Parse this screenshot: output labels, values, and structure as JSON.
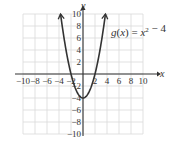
{
  "chart_data": {
    "type": "line",
    "title": "",
    "function_label": "g(x) = x² − 4",
    "function_name": "g(x)",
    "function_expr": "x² − 4",
    "xlabel": "x",
    "ylabel": "y",
    "xlim": [
      -10,
      10
    ],
    "ylim": [
      -10,
      10
    ],
    "grid": true,
    "grid_step": 2,
    "x_ticks": [
      -10,
      -8,
      -6,
      -4,
      -2,
      2,
      4,
      6,
      8,
      10
    ],
    "y_ticks": [
      10,
      8,
      6,
      4,
      2,
      -2,
      -4,
      -6,
      -8,
      -10
    ],
    "x_tick_labels": [
      "−10",
      "−8",
      "−6",
      "−4",
      "−2",
      "2",
      "4",
      "6",
      "8",
      "10"
    ],
    "y_tick_labels": [
      "10",
      "8",
      "6",
      "4",
      "2",
      "−2",
      "−4",
      "−6",
      "−8",
      "−10"
    ],
    "series": [
      {
        "name": "g(x) = x² − 4",
        "x": [
          -3.74,
          -3,
          -2,
          -1,
          0,
          1,
          2,
          3,
          3.74
        ],
        "y": [
          10,
          5,
          0,
          -3,
          -4,
          -3,
          0,
          5,
          10
        ],
        "color": "#333333"
      }
    ],
    "vertex": [
      0,
      -4
    ],
    "x_intercepts": [
      -2,
      2
    ]
  },
  "colors": {
    "grid": "#d9d9d9",
    "axis": "#333333",
    "curve": "#333333"
  }
}
